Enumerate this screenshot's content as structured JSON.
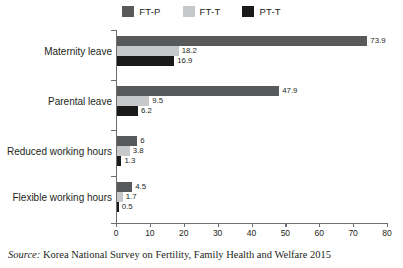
{
  "chart_data": {
    "type": "bar",
    "orientation": "horizontal",
    "title": "",
    "xlabel": "",
    "ylabel": "",
    "xlim": [
      0,
      80
    ],
    "xticks": [
      0,
      10,
      20,
      30,
      40,
      50,
      60,
      70,
      80
    ],
    "grid": false,
    "legend_position": "top-center",
    "categories": [
      "Maternity leave",
      "Parental leave",
      "Reduced working hours",
      "Flexible working hours"
    ],
    "series": [
      {
        "name": "FT-P",
        "color": "#58595b",
        "values": [
          73.9,
          47.9,
          6,
          4.5
        ],
        "labels": [
          "73.9",
          "47.9",
          "6",
          "4.5"
        ]
      },
      {
        "name": "FT-T",
        "color": "#c7c8ca",
        "values": [
          18.2,
          9.5,
          3.8,
          1.7
        ],
        "labels": [
          "18.2",
          "9.5",
          "3.8",
          "1.7"
        ]
      },
      {
        "name": "PT-T",
        "color": "#1a1a1a",
        "values": [
          16.9,
          6.2,
          1.3,
          0.5
        ],
        "labels": [
          "16.9",
          "6.2",
          "1.3",
          "0.5"
        ]
      }
    ],
    "source": {
      "prefix": "Source:",
      "text": " Korea National Survey on Fertility, Family Health and Welfare 2015"
    },
    "axis_color": "#6d6e71"
  }
}
